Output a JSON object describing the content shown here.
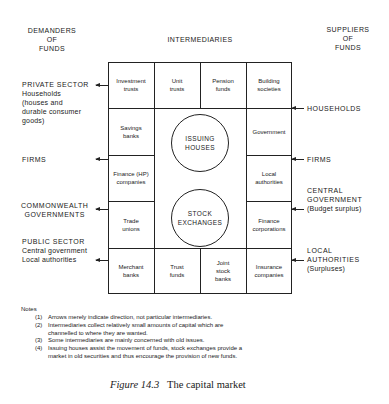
{
  "headers": {
    "demanders": [
      "DEMANDERS",
      "OF",
      "FUNDS"
    ],
    "intermediaries": "INTERMEDIARIES",
    "suppliers": [
      "SUPPLIERS",
      "OF",
      "FUNDS"
    ]
  },
  "demanders": {
    "private_sector": {
      "title": "PRIVATE SECTOR",
      "lines": [
        "Households",
        "(houses and",
        "durable consumer",
        "goods)"
      ]
    },
    "firms": "FIRMS",
    "commonwealth": [
      "COMMONWEALTH",
      "GOVERNMENTS"
    ],
    "public_sector": {
      "title": "PUBLIC SECTOR",
      "lines": [
        "Central government",
        "Local authorities"
      ]
    }
  },
  "suppliers": {
    "households": "HOUSEHOLDS",
    "firms": "FIRMS",
    "central_government": [
      "CENTRAL",
      "GOVERNMENT",
      "(Budget surplus)"
    ],
    "local_authorities": [
      "LOCAL",
      "AUTHORITIES",
      "(Surpluses)"
    ]
  },
  "grid": {
    "top_row": [
      "Investment trusts",
      "Unit trusts",
      "Pension funds",
      "Building societies"
    ],
    "left_col": [
      "Savings banks",
      "Finance (HP) companies",
      "Trade unions"
    ],
    "right_col": [
      "Government",
      "Local authorities",
      "Finance corporations"
    ],
    "bottom_row": [
      "Merchant banks",
      "Trust funds",
      "Joint stock banks",
      "Insurance companies"
    ],
    "center_circles": [
      "ISSUING HOUSES",
      "STOCK EXCHANGES"
    ]
  },
  "notes": {
    "title": "Notes",
    "items": [
      {
        "num": "(1)",
        "lines": [
          "Arrows merely indicate direction, not particular intermediaries."
        ]
      },
      {
        "num": "(2)",
        "lines": [
          "Intermediaries collect relatively small amounts of capital which are",
          "channelled to where they are wanted."
        ]
      },
      {
        "num": "(3)",
        "lines": [
          "Some intermediaries are mainly concerned with old issues."
        ]
      },
      {
        "num": "(4)",
        "lines": [
          "Issuing houses assist the movement of funds, stock exchanges provide a",
          "market in old securities and thus encourage the provision of new funds."
        ]
      }
    ]
  },
  "caption": {
    "label": "Figure 14.3",
    "title": "The capital market"
  }
}
